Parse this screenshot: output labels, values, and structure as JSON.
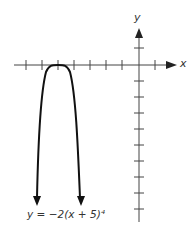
{
  "graph": {
    "x_label": "x",
    "y_label": "y",
    "equation": "y = −2(x + 5)⁴",
    "vertex": [
      -5,
      0
    ],
    "x_ticks": [
      -7,
      -6,
      -5,
      -4,
      -3,
      -2,
      -1,
      1
    ],
    "y_ticks": [
      1,
      -1,
      -2,
      -3,
      -4,
      -5,
      -6,
      -7,
      -8,
      -9
    ],
    "colors": {
      "axis": "#333333",
      "curve": "#111111"
    }
  }
}
